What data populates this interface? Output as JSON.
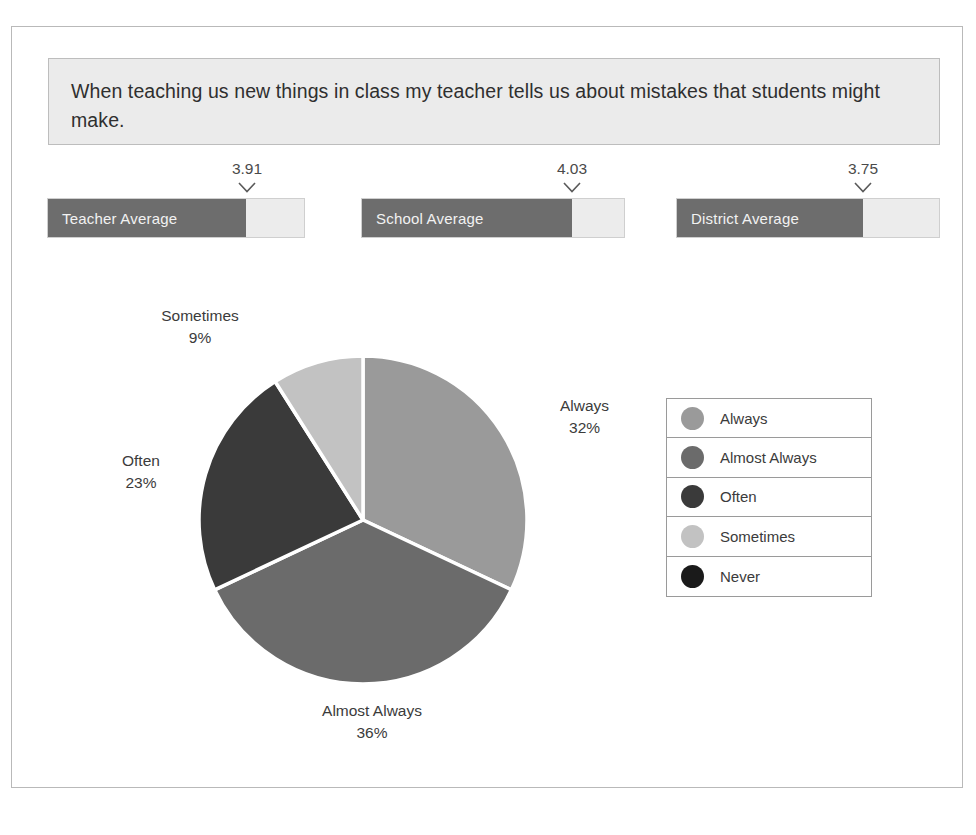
{
  "question": {
    "text": "When teaching us new things in class my teacher tells us about mistakes that students might make."
  },
  "averages": {
    "scale_max": 5,
    "items": [
      {
        "label": "Teacher Average",
        "value": "3.91",
        "numeric": 3.91
      },
      {
        "label": "School Average",
        "value": "4.03",
        "numeric": 4.03
      },
      {
        "label": "District Average",
        "value": "3.75",
        "numeric": 3.75
      }
    ]
  },
  "legend": {
    "items": [
      {
        "label": "Always",
        "color": "#9a9a9a"
      },
      {
        "label": "Almost Always",
        "color": "#6b6b6b"
      },
      {
        "label": "Often",
        "color": "#3a3a3a"
      },
      {
        "label": "Sometimes",
        "color": "#c2c2c2"
      },
      {
        "label": "Never",
        "color": "#1a1a1a"
      }
    ]
  },
  "pie_labels": {
    "always": {
      "name": "Always",
      "percent": "32%"
    },
    "almost_always": {
      "name": "Almost Always",
      "percent": "36%"
    },
    "often": {
      "name": "Often",
      "percent": "23%"
    },
    "sometimes": {
      "name": "Sometimes",
      "percent": "9%"
    }
  },
  "chart_data": {
    "type": "pie",
    "title": "When teaching us new things in class my teacher tells us about mistakes that students might make.",
    "categories": [
      "Always",
      "Almost Always",
      "Often",
      "Sometimes",
      "Never"
    ],
    "values": [
      32,
      36,
      23,
      9,
      0
    ],
    "value_labels": [
      "32%",
      "36%",
      "23%",
      "9%",
      ""
    ],
    "colors": [
      "#9a9a9a",
      "#6b6b6b",
      "#3a3a3a",
      "#c2c2c2",
      "#1a1a1a"
    ],
    "start_angle_deg": 0,
    "direction": "clockwise",
    "slice_separator_color": "#ffffff",
    "legend_position": "right",
    "grid": false,
    "secondary": {
      "type": "bar",
      "orientation": "horizontal",
      "categories": [
        "Teacher Average",
        "School Average",
        "District Average"
      ],
      "values": [
        3.91,
        4.03,
        3.75
      ],
      "xlim": [
        0,
        5
      ],
      "bar_fill_color": "#6d6d6d",
      "bar_track_color": "#ececec"
    }
  }
}
